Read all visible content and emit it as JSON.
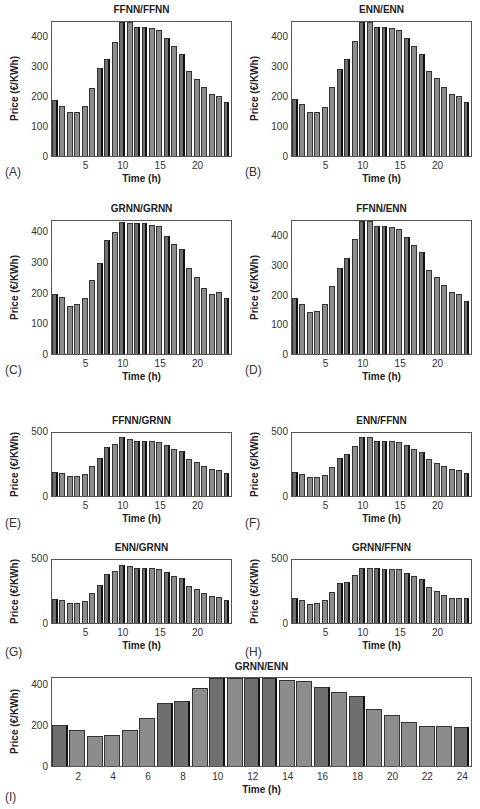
{
  "chart_data": [
    {
      "id": "A",
      "panel_label": "(A)",
      "type": "bar",
      "title": "FFNN/FFNN",
      "xlabel": "Time (h)",
      "ylabel": "Price (€/KWh)",
      "categories": [
        1,
        2,
        3,
        4,
        5,
        6,
        7,
        8,
        9,
        10,
        11,
        12,
        13,
        14,
        15,
        16,
        17,
        18,
        19,
        20,
        21,
        22,
        23,
        24
      ],
      "values": [
        190,
        170,
        148,
        148,
        170,
        232,
        298,
        328,
        388,
        458,
        455,
        438,
        438,
        435,
        428,
        402,
        372,
        348,
        288,
        262,
        235,
        212,
        205,
        185
      ],
      "xticks": [
        5,
        10,
        15,
        20
      ],
      "yticks": [
        0,
        100,
        200,
        300,
        400
      ],
      "ylim": [
        0,
        455
      ],
      "grid": false
    },
    {
      "id": "B",
      "panel_label": "(B)",
      "type": "bar",
      "title": "ENN/ENN",
      "xlabel": "Time (h)",
      "ylabel": "Price (€/KWh)",
      "categories": [
        1,
        2,
        3,
        4,
        5,
        6,
        7,
        8,
        9,
        10,
        11,
        12,
        13,
        14,
        15,
        16,
        17,
        18,
        19,
        20,
        21,
        22,
        23,
        24
      ],
      "values": [
        192,
        175,
        148,
        148,
        168,
        233,
        297,
        328,
        392,
        458,
        455,
        438,
        438,
        435,
        428,
        402,
        372,
        348,
        290,
        265,
        235,
        212,
        205,
        185
      ],
      "xticks": [
        5,
        10,
        15,
        20
      ],
      "yticks": [
        0,
        100,
        200,
        300,
        400
      ],
      "ylim": [
        0,
        455
      ],
      "grid": false
    },
    {
      "id": "C",
      "panel_label": "(C)",
      "type": "bar",
      "title": "GRNN/GRNN",
      "xlabel": "Time (h)",
      "ylabel": "Price (€/KWh)",
      "categories": [
        1,
        2,
        3,
        4,
        5,
        6,
        7,
        8,
        9,
        10,
        11,
        12,
        13,
        14,
        15,
        16,
        17,
        18,
        19,
        20,
        21,
        22,
        23,
        24
      ],
      "values": [
        200,
        190,
        158,
        165,
        185,
        245,
        300,
        378,
        405,
        438,
        435,
        432,
        432,
        428,
        422,
        392,
        365,
        348,
        285,
        255,
        220,
        198,
        205,
        185
      ],
      "xticks": [
        5,
        10,
        15,
        20
      ],
      "yticks": [
        0,
        100,
        200,
        300,
        400
      ],
      "ylim": [
        0,
        440
      ],
      "grid": false
    },
    {
      "id": "D",
      "panel_label": "(D)",
      "type": "bar",
      "title": "FFNN/ENN",
      "xlabel": "Time (h)",
      "ylabel": "Price (€/KWh)",
      "categories": [
        1,
        2,
        3,
        4,
        5,
        6,
        7,
        8,
        9,
        10,
        11,
        12,
        13,
        14,
        15,
        16,
        17,
        18,
        19,
        20,
        21,
        22,
        23,
        24
      ],
      "values": [
        190,
        172,
        145,
        148,
        170,
        232,
        295,
        328,
        392,
        458,
        455,
        438,
        438,
        435,
        428,
        400,
        372,
        348,
        288,
        262,
        235,
        212,
        205,
        182
      ],
      "xticks": [
        5,
        10,
        15,
        20
      ],
      "yticks": [
        0,
        100,
        200,
        300,
        400
      ],
      "ylim": [
        0,
        455
      ],
      "grid": false
    },
    {
      "id": "E",
      "panel_label": "(E)",
      "type": "bar",
      "title": "FFNN/GRNN",
      "xlabel": "Time (h)",
      "ylabel": "Price (€/KWh)",
      "categories": [
        1,
        2,
        3,
        4,
        5,
        6,
        7,
        8,
        9,
        10,
        11,
        12,
        13,
        14,
        15,
        16,
        17,
        18,
        19,
        20,
        21,
        22,
        23,
        24
      ],
      "values": [
        190,
        180,
        155,
        155,
        175,
        240,
        300,
        390,
        415,
        465,
        455,
        440,
        440,
        440,
        432,
        405,
        375,
        355,
        290,
        268,
        240,
        215,
        210,
        180
      ],
      "xticks": [
        5,
        10,
        15,
        20
      ],
      "yticks": [
        0,
        500
      ],
      "ylim": [
        0,
        500
      ],
      "grid": false
    },
    {
      "id": "F",
      "panel_label": "(F)",
      "type": "bar",
      "title": "ENN/FFNN",
      "xlabel": "Time (h)",
      "ylabel": "Price (€/KWh)",
      "categories": [
        1,
        2,
        3,
        4,
        5,
        6,
        7,
        8,
        9,
        10,
        11,
        12,
        13,
        14,
        15,
        16,
        17,
        18,
        19,
        20,
        21,
        22,
        23,
        24
      ],
      "values": [
        190,
        175,
        148,
        152,
        170,
        232,
        298,
        335,
        395,
        465,
        465,
        440,
        440,
        440,
        432,
        402,
        372,
        352,
        290,
        265,
        238,
        215,
        208,
        182
      ],
      "xticks": [
        5,
        10,
        15,
        20
      ],
      "yticks": [
        0,
        500
      ],
      "ylim": [
        0,
        500
      ],
      "grid": false
    },
    {
      "id": "G",
      "panel_label": "(G)",
      "type": "bar",
      "title": "ENN/GRNN",
      "xlabel": "Time (h)",
      "ylabel": "Price (€/KWh)",
      "categories": [
        1,
        2,
        3,
        4,
        5,
        6,
        7,
        8,
        9,
        10,
        11,
        12,
        13,
        14,
        15,
        16,
        17,
        18,
        19,
        20,
        21,
        22,
        23,
        24
      ],
      "values": [
        190,
        180,
        155,
        155,
        175,
        240,
        300,
        388,
        415,
        462,
        452,
        440,
        440,
        440,
        432,
        405,
        375,
        355,
        290,
        268,
        240,
        215,
        210,
        180
      ],
      "xticks": [
        5,
        10,
        15,
        20
      ],
      "yticks": [
        0,
        500
      ],
      "ylim": [
        0,
        500
      ],
      "grid": false
    },
    {
      "id": "H",
      "panel_label": "(H)",
      "type": "bar",
      "title": "GRNN/FFNN",
      "xlabel": "Time (h)",
      "ylabel": "Price (€/KWh)",
      "categories": [
        1,
        2,
        3,
        4,
        5,
        6,
        7,
        8,
        9,
        10,
        11,
        12,
        13,
        14,
        15,
        16,
        17,
        18,
        19,
        20,
        21,
        22,
        23,
        24
      ],
      "values": [
        200,
        180,
        152,
        158,
        180,
        245,
        320,
        328,
        385,
        438,
        438,
        438,
        432,
        432,
        425,
        395,
        370,
        350,
        288,
        258,
        220,
        198,
        202,
        195
      ],
      "xticks": [
        5,
        10,
        15,
        20
      ],
      "yticks": [
        0,
        500
      ],
      "ylim": [
        0,
        500
      ],
      "grid": false
    },
    {
      "id": "I",
      "panel_label": "(I)",
      "type": "bar",
      "title": "GRNN/ENN",
      "xlabel": "Time (h)",
      "ylabel": "Price (€/KWh)",
      "categories": [
        1,
        2,
        3,
        4,
        5,
        6,
        7,
        8,
        9,
        10,
        11,
        12,
        13,
        14,
        15,
        16,
        17,
        18,
        19,
        20,
        21,
        22,
        23,
        24
      ],
      "values": [
        205,
        178,
        150,
        155,
        178,
        242,
        315,
        325,
        390,
        440,
        440,
        440,
        440,
        432,
        425,
        395,
        368,
        348,
        285,
        255,
        222,
        198,
        202,
        195
      ],
      "xticks": [
        2,
        4,
        6,
        8,
        10,
        12,
        14,
        16,
        18,
        20,
        22,
        24
      ],
      "yticks": [
        0,
        200,
        400
      ],
      "ylim": [
        0,
        440
      ],
      "grid": false
    }
  ]
}
